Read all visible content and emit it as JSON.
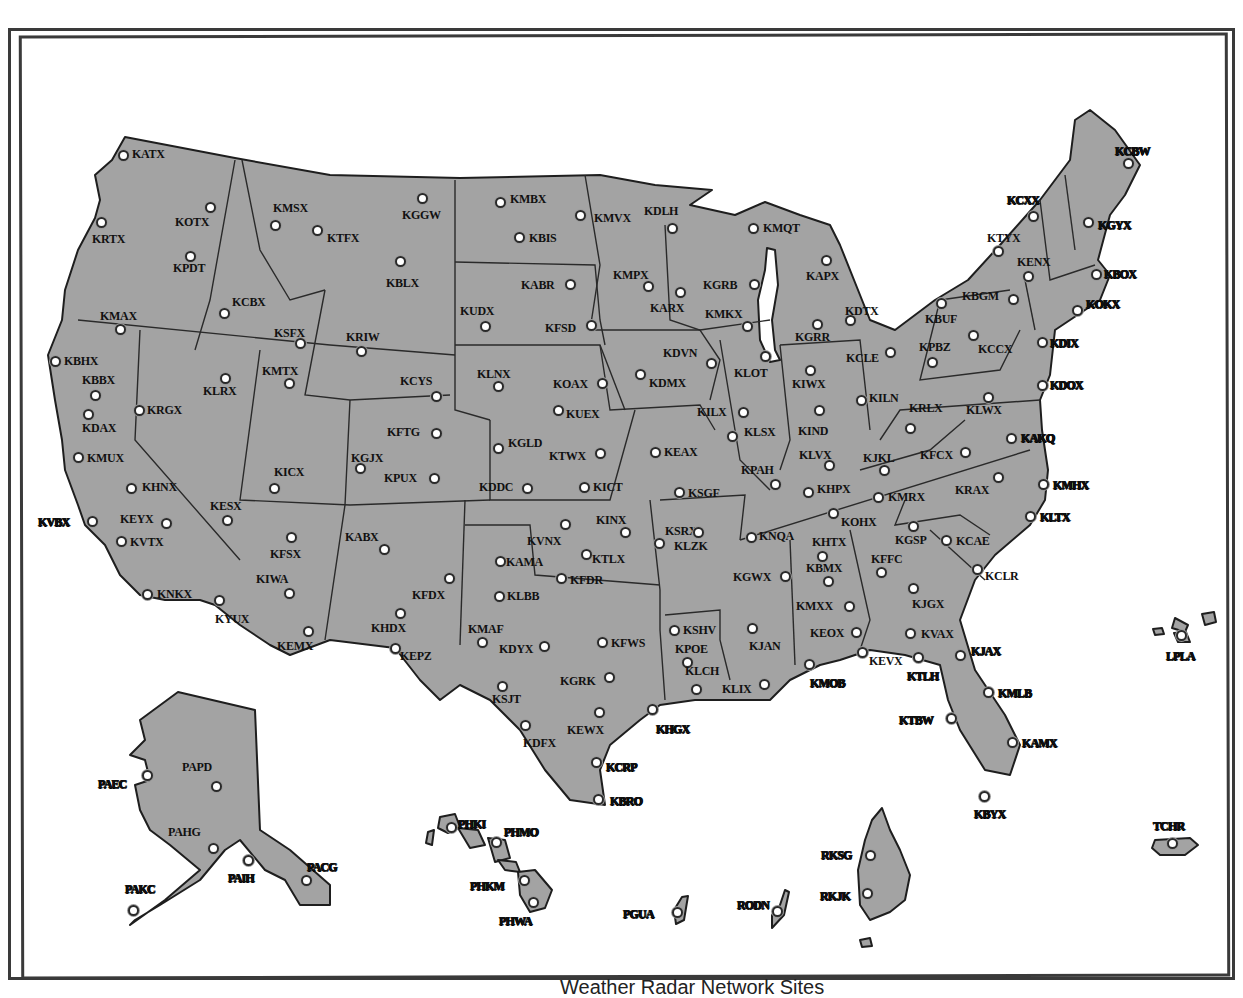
{
  "title": "Weather Radar Network Sites",
  "colors": {
    "land": "#a3a3a3",
    "border": "#1e1e1e",
    "site_fill": "#ffffff",
    "background": "#ffffff"
  },
  "sites": [
    {
      "id": "KATX",
      "x": 123,
      "y": 155,
      "lx": 132,
      "ly": 148
    },
    {
      "id": "KOTX",
      "x": 210,
      "y": 207,
      "lx": 175,
      "ly": 216
    },
    {
      "id": "KRTX",
      "x": 101,
      "y": 222,
      "lx": 92,
      "ly": 233
    },
    {
      "id": "KPDT",
      "x": 190,
      "y": 256,
      "lx": 173,
      "ly": 262
    },
    {
      "id": "KMSX",
      "x": 275,
      "y": 225,
      "lx": 273,
      "ly": 202
    },
    {
      "id": "KTFX",
      "x": 317,
      "y": 230,
      "lx": 327,
      "ly": 232
    },
    {
      "id": "KGGW",
      "x": 422,
      "y": 198,
      "lx": 402,
      "ly": 209
    },
    {
      "id": "KCBX",
      "x": 224,
      "y": 313,
      "lx": 232,
      "ly": 296
    },
    {
      "id": "KSFX",
      "x": 300,
      "y": 343,
      "lx": 274,
      "ly": 327
    },
    {
      "id": "KBLX",
      "x": 400,
      "y": 261,
      "lx": 386,
      "ly": 277
    },
    {
      "id": "KMAX",
      "x": 120,
      "y": 329,
      "lx": 100,
      "ly": 310
    },
    {
      "id": "KBHX",
      "x": 55,
      "y": 361,
      "lx": 64,
      "ly": 355
    },
    {
      "id": "KBBX",
      "x": 95,
      "y": 395,
      "lx": 82,
      "ly": 374
    },
    {
      "id": "KLRX",
      "x": 225,
      "y": 378,
      "lx": 203,
      "ly": 385
    },
    {
      "id": "KMTX",
      "x": 289,
      "y": 383,
      "lx": 262,
      "ly": 365
    },
    {
      "id": "KRGX",
      "x": 139,
      "y": 410,
      "lx": 147,
      "ly": 404
    },
    {
      "id": "KDAX",
      "x": 88,
      "y": 414,
      "lx": 82,
      "ly": 422
    },
    {
      "id": "KMUX",
      "x": 78,
      "y": 457,
      "lx": 87,
      "ly": 452
    },
    {
      "id": "KRIW",
      "x": 361,
      "y": 351,
      "lx": 346,
      "ly": 331
    },
    {
      "id": "KCYS",
      "x": 436,
      "y": 396,
      "lx": 400,
      "ly": 375
    },
    {
      "id": "KMBX",
      "x": 500,
      "y": 202,
      "lx": 510,
      "ly": 193
    },
    {
      "id": "KBIS",
      "x": 519,
      "y": 237,
      "lx": 529,
      "ly": 232
    },
    {
      "id": "KMVX",
      "x": 580,
      "y": 215,
      "lx": 594,
      "ly": 212
    },
    {
      "id": "KDLH",
      "x": 672,
      "y": 228,
      "lx": 644,
      "ly": 205
    },
    {
      "id": "KABR",
      "x": 570,
      "y": 284,
      "lx": 521,
      "ly": 279
    },
    {
      "id": "KUDX",
      "x": 485,
      "y": 326,
      "lx": 460,
      "ly": 305
    },
    {
      "id": "KFSD",
      "x": 591,
      "y": 325,
      "lx": 545,
      "ly": 322
    },
    {
      "id": "KMPX",
      "x": 648,
      "y": 286,
      "lx": 613,
      "ly": 269
    },
    {
      "id": "KARX",
      "x": 680,
      "y": 292,
      "lx": 650,
      "ly": 302
    },
    {
      "id": "KMQT",
      "x": 753,
      "y": 228,
      "lx": 763,
      "ly": 222
    },
    {
      "id": "KGRB",
      "x": 754,
      "y": 284,
      "lx": 703,
      "ly": 279
    },
    {
      "id": "KMKX",
      "x": 747,
      "y": 326,
      "lx": 705,
      "ly": 308
    },
    {
      "id": "KAPX",
      "x": 826,
      "y": 260,
      "lx": 806,
      "ly": 270
    },
    {
      "id": "KGRR",
      "x": 817,
      "y": 324,
      "lx": 795,
      "ly": 331
    },
    {
      "id": "KDTX",
      "x": 850,
      "y": 320,
      "lx": 845,
      "ly": 305
    },
    {
      "id": "KLNX",
      "x": 498,
      "y": 386,
      "lx": 477,
      "ly": 368
    },
    {
      "id": "KOAX",
      "x": 602,
      "y": 383,
      "lx": 553,
      "ly": 378
    },
    {
      "id": "KUEX",
      "x": 558,
      "y": 410,
      "lx": 566,
      "ly": 408
    },
    {
      "id": "KDVN",
      "x": 711,
      "y": 363,
      "lx": 663,
      "ly": 347
    },
    {
      "id": "KDMX",
      "x": 640,
      "y": 374,
      "lx": 649,
      "ly": 377
    },
    {
      "id": "KLOT",
      "x": 765,
      "y": 356,
      "lx": 734,
      "ly": 367
    },
    {
      "id": "KIWX",
      "x": 810,
      "y": 370,
      "lx": 792,
      "ly": 378
    },
    {
      "id": "KCLE",
      "x": 890,
      "y": 352,
      "lx": 846,
      "ly": 352
    },
    {
      "id": "KILN",
      "x": 861,
      "y": 400,
      "lx": 869,
      "ly": 392
    },
    {
      "id": "KILX",
      "x": 743,
      "y": 412,
      "lx": 697,
      "ly": 406
    },
    {
      "id": "KLSX",
      "x": 732,
      "y": 436,
      "lx": 744,
      "ly": 426
    },
    {
      "id": "KIND",
      "x": 819,
      "y": 410,
      "lx": 798,
      "ly": 425
    },
    {
      "id": "KFTG",
      "x": 436,
      "y": 433,
      "lx": 387,
      "ly": 426
    },
    {
      "id": "KGJX",
      "x": 360,
      "y": 468,
      "lx": 351,
      "ly": 452
    },
    {
      "id": "KPUX",
      "x": 434,
      "y": 478,
      "lx": 384,
      "ly": 472
    },
    {
      "id": "KICX",
      "x": 274,
      "y": 488,
      "lx": 274,
      "ly": 466
    },
    {
      "id": "KGLD",
      "x": 498,
      "y": 448,
      "lx": 508,
      "ly": 437
    },
    {
      "id": "KTWX",
      "x": 600,
      "y": 453,
      "lx": 549,
      "ly": 450
    },
    {
      "id": "KDDC",
      "x": 527,
      "y": 488,
      "lx": 479,
      "ly": 481
    },
    {
      "id": "KICT",
      "x": 584,
      "y": 487,
      "lx": 593,
      "ly": 481
    },
    {
      "id": "KEAX",
      "x": 655,
      "y": 452,
      "lx": 664,
      "ly": 446
    },
    {
      "id": "KSGF",
      "x": 679,
      "y": 492,
      "lx": 688,
      "ly": 487
    },
    {
      "id": "KPAH",
      "x": 775,
      "y": 484,
      "lx": 741,
      "ly": 464
    },
    {
      "id": "KLVX",
      ")x": 829,
      "x": 829,
      "y": 465,
      "lx": 799,
      "ly": 449
    },
    {
      "id": "KJKL",
      "x": 884,
      "y": 470,
      "lx": 863,
      "ly": 452
    },
    {
      "id": "KRLX",
      "x": 910,
      "y": 428,
      "lx": 909,
      "ly": 402
    },
    {
      "id": "KFCX",
      "x": 965,
      "y": 452,
      "lx": 920,
      "ly": 449
    },
    {
      "id": "KHPX",
      "x": 808,
      "y": 492,
      "lx": 817,
      "ly": 483
    },
    {
      "id": "KMRX",
      "x": 878,
      "y": 497,
      "lx": 888,
      "ly": 491
    },
    {
      "id": "KOHX",
      "x": 833,
      "y": 513,
      "lx": 841,
      "ly": 516
    },
    {
      "id": "KRAX",
      "x": 998,
      "y": 477,
      "lx": 955,
      "ly": 484
    },
    {
      "id": "KAKQ",
      "x": 1011,
      "y": 438,
      "lx": 1021,
      "ly": 432
    },
    {
      "id": "KMHX",
      "x": 1043,
      "y": 484,
      "lx": 1053,
      "ly": 479
    },
    {
      "id": "KLTX",
      "x": 1030,
      "y": 516,
      "lx": 1040,
      "ly": 511
    },
    {
      "id": "KLWX",
      "x": 988,
      "y": 397,
      "lx": 966,
      "ly": 404
    },
    {
      "id": "KBGM",
      "x": 1013,
      "y": 299,
      "lx": 962,
      "ly": 290
    },
    {
      "id": "KBUF",
      "x": 941,
      "y": 303,
      "lx": 925,
      "ly": 313
    },
    {
      "id": "KPBZ",
      "x": 932,
      "y": 362,
      "lx": 919,
      "ly": 341
    },
    {
      "id": "KCCX",
      "x": 973,
      "y": 335,
      "lx": 978,
      "ly": 343
    },
    {
      "id": "KTYX",
      "x": 998,
      "y": 251,
      "lx": 987,
      "ly": 232
    },
    {
      "id": "KENX",
      "x": 1028,
      "y": 276,
      "lx": 1017,
      "ly": 256
    },
    {
      "id": "KCXX",
      "x": 1033,
      "y": 216,
      "lx": 1007,
      "ly": 194
    },
    {
      "id": "KCBW",
      "x": 1128,
      "y": 163,
      "lx": 1115,
      "ly": 145
    },
    {
      "id": "KGYX",
      "x": 1088,
      "y": 222,
      "lx": 1098,
      "ly": 219
    },
    {
      "id": "KBOX",
      "x": 1096,
      "y": 274,
      "lx": 1104,
      "ly": 268
    },
    {
      "id": "KOKX",
      "x": 1077,
      "y": 310,
      "lx": 1086,
      "ly": 298
    },
    {
      "id": "KDIX",
      "x": 1042,
      "y": 342,
      "lx": 1050,
      "ly": 337
    },
    {
      "id": "KDOX",
      "x": 1042,
      "y": 385,
      "lx": 1050,
      "ly": 379
    },
    {
      "id": "KHNX",
      "x": 131,
      "y": 488,
      "lx": 142,
      "ly": 481
    },
    {
      "id": "KVBX",
      "x": 92,
      "y": 521,
      "lx": 38,
      "ly": 516
    },
    {
      "id": "KEYX",
      "x": 166,
      "y": 523,
      "lx": 120,
      "ly": 513
    },
    {
      "id": "KVTX",
      "x": 121,
      "y": 541,
      "lx": 130,
      "ly": 536
    },
    {
      "id": "KESX",
      "x": 227,
      "y": 520,
      "lx": 210,
      "ly": 500
    },
    {
      "id": "KFSX",
      "x": 291,
      "y": 537,
      "lx": 270,
      "ly": 548
    },
    {
      "id": "KIWA",
      "x": 289,
      "y": 593,
      "lx": 256,
      "ly": 573
    },
    {
      "id": "KNKX",
      "x": 147,
      "y": 594,
      "lx": 157,
      "ly": 588
    },
    {
      "id": "KYUX",
      "x": 219,
      "y": 600,
      "lx": 215,
      "ly": 613
    },
    {
      "id": "KEMX",
      "x": 308,
      "y": 631,
      "lx": 277,
      "ly": 640
    },
    {
      "id": "KABX",
      "x": 384,
      "y": 549,
      "lx": 345,
      "ly": 531
    },
    {
      "id": "KFDX",
      "x": 449,
      "y": 578,
      "lx": 412,
      "ly": 589
    },
    {
      "id": "KHDX",
      "x": 400,
      "y": 613,
      "lx": 371,
      "ly": 622
    },
    {
      "id": "KEPZ",
      "x": 395,
      "y": 648,
      "lx": 400,
      "ly": 650
    },
    {
      "id": "KVNX",
      "x": 565,
      "y": 524,
      "lx": 527,
      "ly": 535
    },
    {
      "id": "KINX",
      "x": 625,
      "y": 532,
      "lx": 596,
      "ly": 514
    },
    {
      "id": "KTLX",
      "x": 586,
      "y": 554,
      "lx": 592,
      "ly": 553
    },
    {
      "id": "KAMA",
      "x": 500,
      "y": 561,
      "lx": 506,
      "ly": 556
    },
    {
      "id": "KFDR",
      "x": 561,
      "y": 578,
      "lx": 570,
      "ly": 574
    },
    {
      "id": "KLBB",
      "x": 499,
      "y": 596,
      "lx": 507,
      "ly": 590
    },
    {
      "id": "KMAF",
      "x": 482,
      "y": 642,
      "lx": 468,
      "ly": 623
    },
    {
      "id": "KDYX",
      "x": 544,
      "y": 646,
      "lx": 499,
      "ly": 643
    },
    {
      "id": "KFWS",
      "x": 602,
      "y": 642,
      "lx": 611,
      "ly": 637
    },
    {
      "id": "KSRX",
      "x": 659,
      "y": 543,
      "lx": 665,
      "ly": 525
    },
    {
      "id": "KLZK",
      "x": 698,
      "y": 532,
      "lx": 674,
      "ly": 540
    },
    {
      "id": "KNQA",
      "x": 751,
      "y": 537,
      "lx": 759,
      "ly": 530
    },
    {
      "id": "KGWX",
      "x": 785,
      "y": 576,
      "lx": 733,
      "ly": 571
    },
    {
      "id": "KHTX",
      "x": 822,
      "y": 556,
      "lx": 812,
      "ly": 536
    },
    {
      "id": "KBMX",
      "x": 828,
      "y": 581,
      "lx": 806,
      "ly": 562
    },
    {
      "id": "KGSP",
      "x": 913,
      "y": 526,
      "lx": 895,
      "ly": 534
    },
    {
      "id": "KCAE",
      "x": 946,
      "y": 540,
      "lx": 956,
      "ly": 535
    },
    {
      "id": "KFFC",
      "x": 881,
      "y": 572,
      "lx": 871,
      "ly": 553
    },
    {
      "id": "KJGX",
      "x": 913,
      "y": 588,
      "lx": 912,
      "ly": 598
    },
    {
      "id": "KCLR",
      "x": 977,
      "y": 569,
      "lx": 985,
      "ly": 570
    },
    {
      "id": "KMXX",
      "x": 849,
      "y": 606,
      "lx": 796,
      "ly": 600
    },
    {
      "id": "KEOX",
      "x": 856,
      "y": 632,
      "lx": 810,
      "ly": 627
    },
    {
      "id": "KVAX",
      "x": 910,
      "y": 633,
      "lx": 921,
      "ly": 628
    },
    {
      "id": "KJAX",
      "x": 960,
      "y": 655,
      "lx": 971,
      "ly": 645
    },
    {
      "id": "KEVX",
      "x": 862,
      "y": 652,
      "lx": 869,
      "ly": 655
    },
    {
      "id": "KTLH",
      "x": 918,
      "y": 657,
      "lx": 907,
      "ly": 670
    },
    {
      "id": "KMOB",
      "x": 809,
      "y": 664,
      "lx": 810,
      "ly": 677
    },
    {
      "id": "KMLB",
      "x": 988,
      "y": 692,
      "lx": 998,
      "ly": 687
    },
    {
      "id": "KTBW",
      "x": 951,
      "y": 718,
      "lx": 899,
      "ly": 714
    },
    {
      "id": "KAMX",
      "x": 1012,
      "y": 742,
      "lx": 1022,
      "ly": 737
    },
    {
      "id": "KBYX",
      "x": 984,
      "y": 796,
      "lx": 974,
      "ly": 808
    },
    {
      "id": "KSHV",
      "x": 674,
      "y": 630,
      "lx": 683,
      "ly": 624
    },
    {
      "id": "KPOE",
      "x": 687,
      "y": 662,
      "lx": 675,
      "ly": 643
    },
    {
      "id": "KLCH",
      "x": 696,
      "y": 689,
      "lx": 685,
      "ly": 665
    },
    {
      "id": "KJAN",
      "x": 752,
      "y": 628,
      "lx": 749,
      "ly": 640
    },
    {
      "id": "KLIX",
      "x": 764,
      "y": 684,
      "lx": 722,
      "ly": 683
    },
    {
      "id": "KGRK",
      "x": 609,
      "y": 677,
      "lx": 560,
      "ly": 675
    },
    {
      "id": "KSJT",
      "x": 502,
      "y": 686,
      "lx": 492,
      "ly": 693
    },
    {
      "id": "KEWX",
      "x": 599,
      "y": 712,
      "lx": 567,
      "ly": 724
    },
    {
      "id": "KHGX",
      "x": 652,
      "y": 709,
      "lx": 656,
      "ly": 723
    },
    {
      "id": "KDFX",
      "x": 525,
      "y": 725,
      "lx": 523,
      "ly": 737
    },
    {
      "id": "KCRP",
      "x": 596,
      "y": 762,
      "lx": 606,
      "ly": 761
    },
    {
      "id": "KBRO",
      "x": 598,
      "y": 799,
      "lx": 610,
      "ly": 795
    },
    {
      "id": "PAEC",
      "x": 147,
      "y": 775,
      "lx": 98,
      "ly": 778
    },
    {
      "id": "PAPD",
      "x": 216,
      "y": 786,
      "lx": 182,
      "ly": 761
    },
    {
      "id": "PAHG",
      "x": 213,
      "y": 848,
      "lx": 168,
      "ly": 826
    },
    {
      "id": "PAIH",
      "x": 248,
      "y": 860,
      "lx": 228,
      "ly": 872
    },
    {
      "id": "PAKC",
      "x": 133,
      "y": 910,
      "lx": 125,
      "ly": 883
    },
    {
      "id": "PACG",
      "x": 306,
      "y": 880,
      "lx": 307,
      "ly": 861
    },
    {
      "id": "PHKI",
      "x": 451,
      "y": 827,
      "lx": 458,
      "ly": 818
    },
    {
      "id": "PHMO",
      "x": 496,
      "y": 842,
      "lx": 504,
      "ly": 826
    },
    {
      "id": "PHKM",
      "x": 524,
      "y": 880,
      "lx": 470,
      "ly": 880
    },
    {
      "id": "PHWA",
      "x": 533,
      "y": 902,
      "lx": 499,
      "ly": 915
    },
    {
      "id": "PGUA",
      "x": 677,
      "y": 912,
      "lx": 623,
      "ly": 908
    },
    {
      "id": "RODN",
      "x": 777,
      "y": 911,
      "lx": 737,
      "ly": 899
    },
    {
      "id": "RKSG",
      "x": 870,
      "y": 855,
      "lx": 821,
      "ly": 849
    },
    {
      "id": "RKJK",
      "x": 867,
      "y": 893,
      "lx": 820,
      "ly": 890
    },
    {
      "id": "TCHR",
      "x": 1172,
      "y": 843,
      "lx": 1153,
      "ly": 820
    },
    {
      "id": "LPLA",
      "x": 1181,
      "y": 635,
      "lx": 1166,
      "ly": 650
    }
  ],
  "bold_labels": [
    "KVBX",
    "KHGX",
    "KCRP",
    "KBRO",
    "KMOB",
    "KTLH",
    "KJAX",
    "KMLB",
    "KTBW",
    "KAMX",
    "KBYX",
    "KCLX",
    "KLTX",
    "KMHX",
    "KAKQ",
    "KDOX",
    "KDIX",
    "KOKX",
    "KBOX",
    "KGYX",
    "KCBW",
    "KCXX",
    "PAEC",
    "PAIH",
    "PAKC",
    "PACG",
    "PHKI",
    "PHMO",
    "PHKM",
    "PHWA",
    "PGUA",
    "RODN",
    "RKSG",
    "RKJK",
    "TCHR",
    "LPLA"
  ]
}
